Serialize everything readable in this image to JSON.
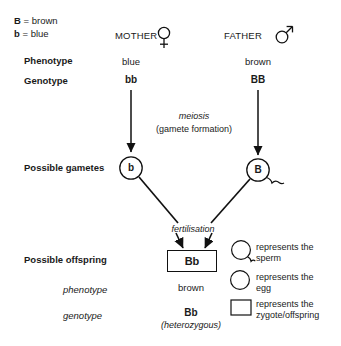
{
  "diagram": {
    "key": {
      "allele_dominant": "B",
      "allele_dominant_eq": "= brown",
      "allele_recessive": "b",
      "allele_recessive_eq": "= blue"
    },
    "row_labels": {
      "phenotype": "Phenotype",
      "genotype": "Genotype",
      "possible_gametes": "Possible gametes",
      "possible_offspring": "Possible offspring",
      "offspring_phenotype": "phenotype",
      "offspring_genotype": "genotype"
    },
    "parents": [
      {
        "name": "MOTHER",
        "symbol": "female",
        "phenotype": "blue",
        "genotype": "bb",
        "gamete": "b",
        "gamete_type": "egg"
      },
      {
        "name": "FATHER",
        "symbol": "male",
        "phenotype": "brown",
        "genotype": "BB",
        "gamete": "B",
        "gamete_type": "sperm"
      }
    ],
    "process_labels": {
      "meiosis": "meiosis",
      "meiosis_sub": "(gamete formation)",
      "fertilisation": "fertilisation"
    },
    "offspring": {
      "zygote_genotype": "Bb",
      "phenotype": "brown",
      "genotype": "Bb",
      "zygosity": "(heterozygous)"
    },
    "legend": [
      {
        "icon": "sperm",
        "line1": "represents the",
        "line2": "sperm"
      },
      {
        "icon": "egg",
        "line1": "represents the",
        "line2": "egg"
      },
      {
        "icon": "zygote",
        "line1": "represents the",
        "line2": "zygote/offspring"
      }
    ],
    "colors": {
      "ink": "#111111",
      "background": "#ffffff"
    }
  }
}
